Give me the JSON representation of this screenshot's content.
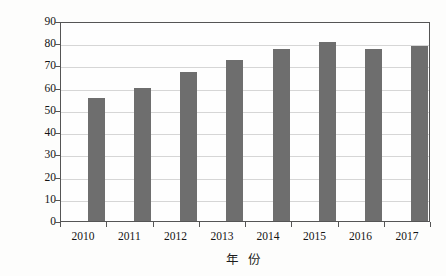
{
  "chart_data": {
    "type": "bar",
    "title": "",
    "subtitle": "",
    "xlabel": "年 份",
    "ylabel": "栽培面积（万hm²）",
    "ylabel_main": "栽培面积（万hm",
    "ylabel_sup": "2",
    "ylabel_tail": "）",
    "categories": [
      "2010",
      "2011",
      "2012",
      "2013",
      "2014",
      "2015",
      "2016",
      "2017"
    ],
    "values": [
      55.5,
      60.0,
      67.0,
      72.3,
      77.5,
      80.7,
      77.2,
      78.7
    ],
    "series": [
      {
        "name": "栽培面积",
        "values": [
          55.5,
          60.0,
          67.0,
          72.3,
          77.5,
          80.7,
          77.2,
          78.7
        ]
      }
    ],
    "ylim": [
      0,
      90
    ],
    "ytick_values": [
      0,
      10,
      20,
      30,
      40,
      50,
      60,
      70,
      80,
      90
    ],
    "ytick_labels": [
      "0",
      "10",
      "20",
      "30",
      "40",
      "50",
      "60",
      "70",
      "80",
      "90"
    ],
    "grid": true,
    "grid_axis": "y",
    "legend": false,
    "legend_position": "none",
    "bar_color": "#6e6e6e",
    "grid_color": "#d6d6d6",
    "frame_color": "#555555",
    "background_color": "#fefefe"
  }
}
